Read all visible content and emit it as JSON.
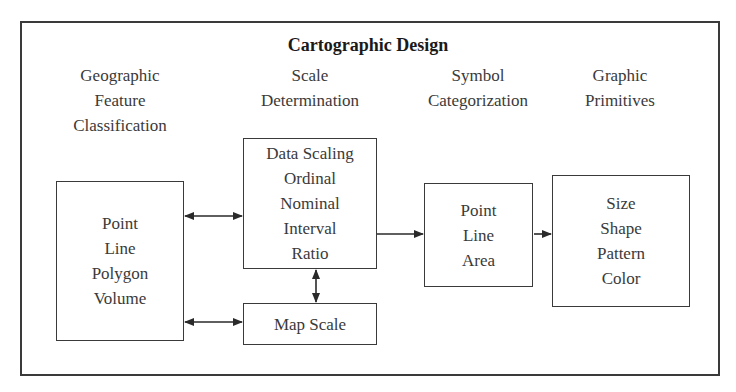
{
  "diagram": {
    "title": "Cartographic Design",
    "columns": [
      {
        "heading": [
          "Geographic",
          "Feature",
          "Classification"
        ]
      },
      {
        "heading": [
          "Scale",
          "Determination"
        ]
      },
      {
        "heading": [
          "Symbol",
          "Categorization"
        ]
      },
      {
        "heading": [
          "Graphic",
          "Primitives"
        ]
      }
    ],
    "boxes": {
      "feature_types": [
        "Point",
        "Line",
        "Polygon",
        "Volume"
      ],
      "data_scaling": [
        "Data Scaling",
        "Ordinal",
        "Nominal",
        "Interval",
        "Ratio"
      ],
      "map_scale": [
        "Map Scale"
      ],
      "symbol_types": [
        "Point",
        "Line",
        "Area"
      ],
      "graphic_primitives": [
        "Size",
        "Shape",
        "Pattern",
        "Color"
      ]
    },
    "connections": [
      {
        "from": "feature_types",
        "to": "data_scaling",
        "type": "bidirectional"
      },
      {
        "from": "feature_types",
        "to": "map_scale",
        "type": "bidirectional"
      },
      {
        "from": "data_scaling",
        "to": "map_scale",
        "type": "bidirectional"
      },
      {
        "from": "data_scaling",
        "to": "symbol_types",
        "type": "directed"
      },
      {
        "from": "symbol_types",
        "to": "graphic_primitives",
        "type": "directed"
      }
    ],
    "colors": {
      "line": "#3a3a3a",
      "text": "#333333",
      "background": "#ffffff"
    }
  }
}
